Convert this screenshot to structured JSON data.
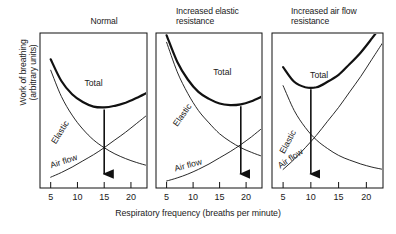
{
  "figure": {
    "axis": {
      "ylabel": "Work of breathing\n(arbitrary units)",
      "xlabel": "Respiratory frequency (breaths per minute)",
      "tick_labels": [
        "5",
        "10",
        "15",
        "20"
      ],
      "tick_values": [
        5,
        10,
        15,
        20
      ]
    },
    "curve_labels": {
      "total": "Total",
      "elastic": "Elastic",
      "airflow": "Air flow"
    },
    "panels": [
      {
        "title": "Normal",
        "optimum": 15
      },
      {
        "title": "Increased elastic\nresistance",
        "optimum": 19
      },
      {
        "title": "Increased air flow\nresistance",
        "optimum": 10
      }
    ]
  },
  "chart_data": {
    "type": "line",
    "xlabel": "Respiratory frequency (breaths per minute)",
    "ylabel": "Work of breathing (arbitrary units)",
    "xlim": [
      3,
      23
    ],
    "ylim": [
      0,
      10
    ],
    "xticks": [
      5,
      10,
      15,
      20
    ],
    "grid": false,
    "legend": "inline-curve-labels",
    "panels": [
      {
        "title": "Normal",
        "optimum_frequency": 15,
        "series": [
          {
            "name": "Elastic",
            "x": [
              5,
              7,
              9,
              11,
              13,
              15,
              17,
              19,
              21,
              23
            ],
            "values": [
              7.6,
              5.9,
              4.7,
              3.8,
              3.1,
              2.6,
              2.2,
              1.9,
              1.65,
              1.45
            ]
          },
          {
            "name": "Air flow",
            "x": [
              5,
              7,
              9,
              11,
              13,
              15,
              17,
              19,
              21,
              23
            ],
            "values": [
              0.7,
              1.0,
              1.35,
              1.75,
              2.15,
              2.6,
              3.1,
              3.6,
              4.15,
              4.7
            ]
          },
          {
            "name": "Total",
            "x": [
              5,
              7,
              9,
              11,
              13,
              15,
              17,
              19,
              21,
              23
            ],
            "values": [
              8.3,
              6.9,
              6.05,
              5.55,
              5.25,
              5.2,
              5.3,
              5.5,
              5.8,
              6.15
            ]
          }
        ]
      },
      {
        "title": "Increased elastic resistance",
        "optimum_frequency": 19,
        "series": [
          {
            "name": "Elastic",
            "x": [
              5,
              7,
              9,
              11,
              13,
              15,
              17,
              19,
              21,
              23
            ],
            "values": [
              9.4,
              7.5,
              6.1,
              5.0,
              4.2,
              3.5,
              3.0,
              2.6,
              2.3,
              2.05
            ]
          },
          {
            "name": "Air flow",
            "x": [
              5,
              7,
              9,
              11,
              13,
              15,
              17,
              19,
              21,
              23
            ],
            "values": [
              0.45,
              0.65,
              0.9,
              1.2,
              1.55,
              1.95,
              2.35,
              2.8,
              3.3,
              3.85
            ]
          },
          {
            "name": "Total",
            "x": [
              5,
              7,
              9,
              11,
              13,
              15,
              17,
              19,
              21,
              23
            ],
            "values": [
              9.85,
              8.15,
              7.0,
              6.2,
              5.75,
              5.45,
              5.35,
              5.4,
              5.6,
              5.9
            ]
          }
        ]
      },
      {
        "title": "Increased air flow resistance",
        "optimum_frequency": 10,
        "series": [
          {
            "name": "Elastic",
            "x": [
              5,
              7,
              9,
              11,
              13,
              15,
              17,
              19,
              21,
              23
            ],
            "values": [
              6.6,
              5.0,
              3.9,
              3.1,
              2.55,
              2.1,
              1.8,
              1.55,
              1.35,
              1.2
            ]
          },
          {
            "name": "Air flow",
            "x": [
              5,
              7,
              9,
              11,
              13,
              15,
              17,
              19,
              21,
              23
            ],
            "values": [
              1.2,
              1.85,
              2.6,
              3.4,
              4.3,
              5.2,
              6.2,
              7.2,
              8.3,
              9.4
            ]
          },
          {
            "name": "Total",
            "x": [
              5,
              7,
              9,
              11,
              13,
              15,
              17,
              19,
              21,
              23
            ],
            "values": [
              7.8,
              6.85,
              6.5,
              6.5,
              6.85,
              7.3,
              8.0,
              8.75,
              9.65,
              10.6
            ]
          }
        ]
      }
    ],
    "annotations": [
      {
        "panel": 0,
        "type": "arrow",
        "at_x": 15,
        "meaning": "optimum frequency (minimum total work)"
      },
      {
        "panel": 1,
        "type": "arrow",
        "at_x": 19,
        "meaning": "optimum frequency (minimum total work)"
      },
      {
        "panel": 2,
        "type": "arrow",
        "at_x": 10,
        "meaning": "optimum frequency (minimum total work)"
      }
    ]
  }
}
